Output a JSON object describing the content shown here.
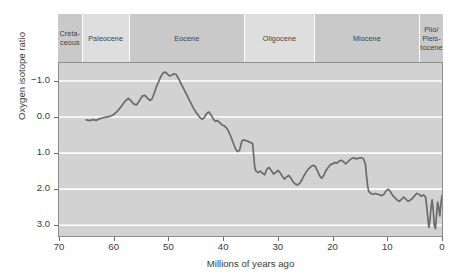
{
  "chart_data": {
    "type": "line",
    "title": "",
    "xlabel": "Millions of years ago",
    "ylabel": "Oxygen isotope ratio",
    "xlim": [
      70,
      0
    ],
    "ylim": [
      -1.5,
      3.3
    ],
    "y_inverted": true,
    "grid": "horizontal-white",
    "legend": "none",
    "x_ticks": [
      "70",
      "60",
      "50",
      "40",
      "30",
      "20",
      "10",
      "0"
    ],
    "x_tick_values": [
      70,
      60,
      50,
      40,
      30,
      20,
      10,
      0
    ],
    "y_ticks": [
      "−1.0",
      "0.0",
      "1.0",
      "2.0",
      "3.0"
    ],
    "y_tick_values": [
      -1.0,
      0.0,
      1.0,
      2.0,
      3.0
    ],
    "series_name": "Oxygen isotope ratio",
    "line_color": "#6b6b6b",
    "plot_background": "#d2d2d2",
    "gridline_color": "#ffffff",
    "points": [
      [
        65.0,
        0.08
      ],
      [
        64.4,
        0.1
      ],
      [
        63.8,
        0.07
      ],
      [
        63.2,
        0.09
      ],
      [
        62.6,
        0.05
      ],
      [
        62.0,
        0.02
      ],
      [
        61.4,
        0.0
      ],
      [
        60.8,
        -0.02
      ],
      [
        60.2,
        -0.05
      ],
      [
        59.6,
        -0.12
      ],
      [
        59.0,
        -0.22
      ],
      [
        58.4,
        -0.34
      ],
      [
        57.8,
        -0.46
      ],
      [
        57.3,
        -0.52
      ],
      [
        56.8,
        -0.44
      ],
      [
        56.3,
        -0.36
      ],
      [
        55.8,
        -0.34
      ],
      [
        55.3,
        -0.45
      ],
      [
        54.8,
        -0.58
      ],
      [
        54.3,
        -0.6
      ],
      [
        53.8,
        -0.52
      ],
      [
        53.4,
        -0.46
      ],
      [
        53.0,
        -0.5
      ],
      [
        52.6,
        -0.66
      ],
      [
        52.2,
        -0.84
      ],
      [
        51.8,
        -0.98
      ],
      [
        51.4,
        -1.12
      ],
      [
        51.0,
        -1.22
      ],
      [
        50.6,
        -1.25
      ],
      [
        50.2,
        -1.2
      ],
      [
        49.8,
        -1.14
      ],
      [
        49.4,
        -1.16
      ],
      [
        49.0,
        -1.2
      ],
      [
        48.6,
        -1.18
      ],
      [
        48.2,
        -1.08
      ],
      [
        47.8,
        -0.96
      ],
      [
        47.4,
        -0.84
      ],
      [
        47.0,
        -0.72
      ],
      [
        46.6,
        -0.6
      ],
      [
        46.2,
        -0.48
      ],
      [
        45.8,
        -0.36
      ],
      [
        45.4,
        -0.24
      ],
      [
        45.0,
        -0.14
      ],
      [
        44.6,
        -0.06
      ],
      [
        44.2,
        0.02
      ],
      [
        43.8,
        0.06
      ],
      [
        43.4,
        0.0
      ],
      [
        43.0,
        -0.1
      ],
      [
        42.6,
        -0.14
      ],
      [
        42.2,
        -0.06
      ],
      [
        41.8,
        0.06
      ],
      [
        41.4,
        0.12
      ],
      [
        41.0,
        0.1
      ],
      [
        40.6,
        0.16
      ],
      [
        40.2,
        0.22
      ],
      [
        39.8,
        0.24
      ],
      [
        39.4,
        0.3
      ],
      [
        39.0,
        0.4
      ],
      [
        38.6,
        0.54
      ],
      [
        38.2,
        0.7
      ],
      [
        37.8,
        0.86
      ],
      [
        37.4,
        0.96
      ],
      [
        37.0,
        0.92
      ],
      [
        36.8,
        0.8
      ],
      [
        36.6,
        0.68
      ],
      [
        36.4,
        0.64
      ],
      [
        36.2,
        0.64
      ],
      [
        36.0,
        0.64
      ],
      [
        35.8,
        0.66
      ],
      [
        35.6,
        0.66
      ],
      [
        35.4,
        0.68
      ],
      [
        35.2,
        0.7
      ],
      [
        35.0,
        0.7
      ],
      [
        34.8,
        0.72
      ],
      [
        34.6,
        0.74
      ],
      [
        34.4,
        1.1
      ],
      [
        34.2,
        1.42
      ],
      [
        34.0,
        1.5
      ],
      [
        33.6,
        1.54
      ],
      [
        33.2,
        1.5
      ],
      [
        32.8,
        1.56
      ],
      [
        32.4,
        1.6
      ],
      [
        32.0,
        1.44
      ],
      [
        31.6,
        1.4
      ],
      [
        31.2,
        1.48
      ],
      [
        30.8,
        1.58
      ],
      [
        30.4,
        1.54
      ],
      [
        30.0,
        1.48
      ],
      [
        29.6,
        1.54
      ],
      [
        29.2,
        1.64
      ],
      [
        28.8,
        1.72
      ],
      [
        28.4,
        1.66
      ],
      [
        28.0,
        1.62
      ],
      [
        27.6,
        1.7
      ],
      [
        27.2,
        1.8
      ],
      [
        26.8,
        1.86
      ],
      [
        26.4,
        1.88
      ],
      [
        26.0,
        1.84
      ],
      [
        25.6,
        1.74
      ],
      [
        25.2,
        1.62
      ],
      [
        24.8,
        1.52
      ],
      [
        24.4,
        1.44
      ],
      [
        24.0,
        1.38
      ],
      [
        23.6,
        1.34
      ],
      [
        23.2,
        1.36
      ],
      [
        22.8,
        1.48
      ],
      [
        22.4,
        1.62
      ],
      [
        22.0,
        1.7
      ],
      [
        21.6,
        1.62
      ],
      [
        21.2,
        1.48
      ],
      [
        20.8,
        1.4
      ],
      [
        20.4,
        1.32
      ],
      [
        20.0,
        1.3
      ],
      [
        19.6,
        1.26
      ],
      [
        19.2,
        1.28
      ],
      [
        18.8,
        1.22
      ],
      [
        18.4,
        1.2
      ],
      [
        18.0,
        1.24
      ],
      [
        17.6,
        1.3
      ],
      [
        17.2,
        1.24
      ],
      [
        16.8,
        1.18
      ],
      [
        16.4,
        1.14
      ],
      [
        16.0,
        1.14
      ],
      [
        15.6,
        1.16
      ],
      [
        15.2,
        1.14
      ],
      [
        14.8,
        1.13
      ],
      [
        14.4,
        1.15
      ],
      [
        14.0,
        1.3
      ],
      [
        13.8,
        1.62
      ],
      [
        13.6,
        1.9
      ],
      [
        13.4,
        2.06
      ],
      [
        13.0,
        2.12
      ],
      [
        12.6,
        2.14
      ],
      [
        12.2,
        2.12
      ],
      [
        11.8,
        2.14
      ],
      [
        11.4,
        2.16
      ],
      [
        11.0,
        2.18
      ],
      [
        10.6,
        2.14
      ],
      [
        10.2,
        2.04
      ],
      [
        9.8,
        2.0
      ],
      [
        9.4,
        2.08
      ],
      [
        9.0,
        2.18
      ],
      [
        8.6,
        2.24
      ],
      [
        8.2,
        2.3
      ],
      [
        7.8,
        2.34
      ],
      [
        7.4,
        2.28
      ],
      [
        7.0,
        2.22
      ],
      [
        6.6,
        2.28
      ],
      [
        6.2,
        2.34
      ],
      [
        5.8,
        2.3
      ],
      [
        5.4,
        2.26
      ],
      [
        5.0,
        2.18
      ],
      [
        4.6,
        2.12
      ],
      [
        4.2,
        2.14
      ],
      [
        3.8,
        2.2
      ],
      [
        3.4,
        2.16
      ],
      [
        3.0,
        2.22
      ],
      [
        2.8,
        2.48
      ],
      [
        2.6,
        2.78
      ],
      [
        2.4,
        3.06
      ],
      [
        2.2,
        2.86
      ],
      [
        2.0,
        2.5
      ],
      [
        1.8,
        2.3
      ],
      [
        1.6,
        2.6
      ],
      [
        1.4,
        3.0
      ],
      [
        1.2,
        3.1
      ],
      [
        1.0,
        2.72
      ],
      [
        0.8,
        2.36
      ],
      [
        0.6,
        2.52
      ],
      [
        0.4,
        2.74
      ],
      [
        0.2,
        2.4
      ],
      [
        0.0,
        2.18
      ]
    ],
    "epochs": [
      {
        "name": "Creta-\nceous",
        "label_lines": [
          "Creta-",
          "ceous"
        ],
        "start": 70,
        "end": 65.5,
        "shade": "dark"
      },
      {
        "name": "Paleocene",
        "label_lines": [
          "Paleocene"
        ],
        "start": 65.5,
        "end": 57.0,
        "shade": "light"
      },
      {
        "name": "Eocene",
        "label_lines": [
          "Eocene"
        ],
        "start": 57.0,
        "end": 36.0,
        "shade": "dark"
      },
      {
        "name": "Oligocene",
        "label_lines": [
          "Oligocene"
        ],
        "start": 36.0,
        "end": 23.3,
        "shade": "light"
      },
      {
        "name": "Miocene",
        "label_lines": [
          "Miocene"
        ],
        "start": 23.3,
        "end": 4.2,
        "shade": "dark"
      },
      {
        "name": "Plio/Pleistocene",
        "label_lines": [
          "Plio/",
          "Pleis-",
          "tocene"
        ],
        "start": 4.2,
        "end": 0,
        "shade": "dark"
      }
    ]
  },
  "colors": {
    "epoch_light": "#dedede",
    "epoch_dark": "#c9c9c9",
    "plot_bg": "#d2d2d2",
    "line": "#6b6b6b",
    "grid": "#ffffff",
    "axis": "#8d8d8d",
    "text": "#3a3a3a"
  }
}
